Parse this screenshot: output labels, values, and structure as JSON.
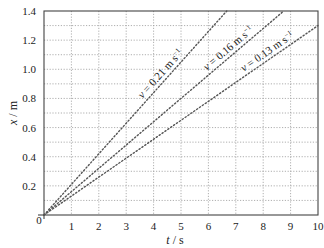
{
  "chart_data": {
    "type": "line",
    "title": "",
    "xlabel": "t / s",
    "ylabel": "x / m",
    "xlim": [
      0,
      10
    ],
    "ylim": [
      0,
      1.4
    ],
    "x_ticks": [
      "0",
      "1",
      "2",
      "3",
      "4",
      "5",
      "6",
      "7",
      "8",
      "9",
      "10"
    ],
    "y_ticks": [
      "0.2",
      "0.4",
      "0.6",
      "0.8",
      "1.0",
      "1.2",
      "1.4"
    ],
    "grid": true,
    "grid_minor_y_step": 0.1,
    "series": [
      {
        "name": "v = 0.21 m s⁻¹",
        "slope": 0.21,
        "x": [
          0,
          6.67
        ],
        "y": [
          0,
          1.4
        ]
      },
      {
        "name": "v = 0.16 m s⁻¹",
        "slope": 0.16,
        "x": [
          0,
          8.75
        ],
        "y": [
          0,
          1.4
        ]
      },
      {
        "name": "v = 0.13 m s⁻¹",
        "slope": 0.13,
        "x": [
          0,
          10
        ],
        "y": [
          0,
          1.3
        ]
      }
    ],
    "annotations": [
      {
        "text": "v = 0.21 m s⁻¹",
        "series": 0
      },
      {
        "text": "v = 0.16 m s⁻¹",
        "series": 1
      },
      {
        "text": "v = 0.13 m s⁻¹",
        "series": 2
      }
    ]
  },
  "labels": {
    "x_axis": "t / s",
    "y_axis": "x / m",
    "origin": "0"
  },
  "colors": {
    "axis": "#444444",
    "grid": "#9a9a9a",
    "line": "#555555",
    "text": "#222222"
  }
}
